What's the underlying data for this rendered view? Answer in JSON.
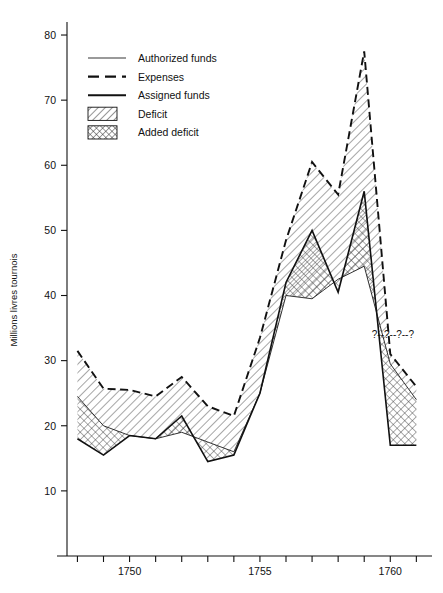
{
  "chart_data": {
    "type": "line",
    "title": "",
    "subtitle": "",
    "xlabel": "",
    "ylabel": "Millions livres tournois",
    "xlim": [
      1747.6,
      1761.6
    ],
    "ylim": [
      0,
      82
    ],
    "yticks": [
      10,
      20,
      30,
      40,
      50,
      60,
      70,
      80
    ],
    "ytick_labels": [
      "10",
      "20",
      "30",
      "40",
      "50",
      "60",
      "70",
      "80"
    ],
    "xticks": [
      1748,
      1749,
      1750,
      1751,
      1752,
      1753,
      1754,
      1755,
      1756,
      1757,
      1758,
      1759,
      1760,
      1761
    ],
    "xtick_labels_shown": [
      "1750",
      "1755",
      "1760"
    ],
    "xtick_labelled_values": [
      1750,
      1755,
      1760
    ],
    "grid": false,
    "legend_position": "upper-left-inside",
    "x": [
      1748,
      1749,
      1750,
      1751,
      1752,
      1753,
      1754,
      1755,
      1756,
      1757,
      1758,
      1759,
      1760,
      1761
    ],
    "series": [
      {
        "name": "Expenses",
        "style": "dashed",
        "values": [
          31.5,
          25.7,
          25.5,
          24.5,
          27.5,
          23.0,
          21.5,
          33.5,
          48.5,
          60.5,
          55.5,
          77.5,
          31.0,
          26.0
        ]
      },
      {
        "name": "Authorized funds",
        "style": "thin-solid",
        "values": [
          24.5,
          20.0,
          18.5,
          18.0,
          19.0,
          17.5,
          16.0,
          25.0,
          40.0,
          39.5,
          42.5,
          44.5,
          29.5,
          24.0
        ]
      },
      {
        "name": "Assigned funds",
        "style": "thick-solid",
        "values": [
          18.0,
          15.5,
          18.5,
          18.0,
          21.5,
          14.5,
          15.5,
          25.0,
          42.0,
          50.0,
          40.5,
          56.0,
          17.0,
          17.0
        ]
      }
    ],
    "bands": [
      {
        "name": "Deficit",
        "pattern": "diagonal-hatch",
        "between": [
          "Expenses",
          "Authorized funds"
        ]
      },
      {
        "name": "Added deficit",
        "pattern": "cross-hatch",
        "between": [
          "Authorized funds",
          "Assigned funds"
        ]
      }
    ],
    "annotations": [
      {
        "text": "?--?--?--?",
        "x": 1760.1,
        "y": 33.5
      }
    ]
  },
  "legend": {
    "entries": [
      {
        "label": "Authorized funds",
        "swatch": "thin-line"
      },
      {
        "label": "Expenses",
        "swatch": "dashed-line"
      },
      {
        "label": "Assigned funds",
        "swatch": "thick-line"
      },
      {
        "label": "Deficit",
        "swatch": "diagonal-hatch-box"
      },
      {
        "label": "Added deficit",
        "swatch": "cross-hatch-box"
      }
    ]
  },
  "axes": {
    "y_label": "Millions livres tournois",
    "y_tick_labels": [
      "80",
      "70",
      "60",
      "50",
      "40",
      "30",
      "20",
      "10"
    ],
    "x_tick_labels": [
      "1750",
      "1755",
      "1760"
    ]
  },
  "colors": {
    "ink": "#111111",
    "background": "#ffffff",
    "hatch": "#3a3a3a"
  }
}
